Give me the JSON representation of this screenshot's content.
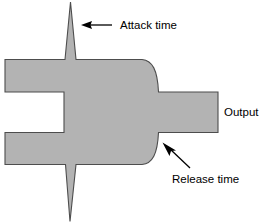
{
  "figure": {
    "kind": "compressor-envelope-diagram",
    "background_color": "#ffffff",
    "waveform_fill_color": "#b3b3b3",
    "waveform_stroke_color": "#4d4d4d",
    "annotation_color": "#000000"
  },
  "labels": {
    "attack": "Attack time",
    "release": "Release time",
    "output": "Output"
  },
  "annotations": {
    "attack_arrow": {
      "name": "attack-time-arrow",
      "direction": "left",
      "tail_x": 112,
      "tail_y": 25,
      "head_x": 82,
      "head_y": 25
    },
    "release_arrow": {
      "name": "release-time-arrow",
      "direction": "up-left",
      "tail_x": 190,
      "tail_y": 168,
      "head_x": 163,
      "head_y": 143
    }
  },
  "shape": {
    "description": "Symmetric audio envelope: fast attack spikes top and bottom, flat sustain body, curved release tapering into a lower-level output tail.",
    "path": "M 70.5 2 L 76.5 60.0 L 143.0 60.0 C 155.0 60.5 158.5 72.0 159.0 92.5 L 218.0 92.5 L 218.0 132.0 L 158.5 132.0 C 157.5 152.5 152.0 164.0 140.0 165.0 L 76.5 165.0 L 70.0 221.5 L 65.5 165.0 L 5.0 165.0 L 5.0 132.0 L 64.0 132.0 L 64.0 92.5 L 5.0 92.5 L 5.0 60.0 L 65.0 60.0 Z"
  },
  "text_positions": {
    "attack": {
      "x": 120,
      "y": 29
    },
    "release": {
      "x": 172,
      "y": 183
    },
    "output": {
      "x": 224,
      "y": 116
    }
  }
}
